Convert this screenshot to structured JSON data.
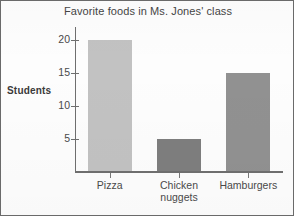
{
  "chart_data": {
    "type": "bar",
    "title": "Favorite foods in Ms. Jones' class",
    "xlabel": "",
    "ylabel": "Students",
    "categories": [
      "Pizza",
      "Chicken\nnuggets",
      "Hamburgers"
    ],
    "values": [
      20,
      5,
      15
    ],
    "bar_colors": [
      "#c2c2c2",
      "#7e7e7e",
      "#919191"
    ],
    "ylim": [
      0,
      22
    ],
    "yticks": [
      5,
      10,
      15,
      20
    ],
    "ytick_labels": [
      "5",
      "10",
      "15",
      "20"
    ],
    "grid": false,
    "legend": "none"
  },
  "style": {
    "axis_color": "#6f6f6f",
    "text_color": "#4a4a4a",
    "border_color": "#6a6a6a",
    "background": "#fdfdfd"
  }
}
